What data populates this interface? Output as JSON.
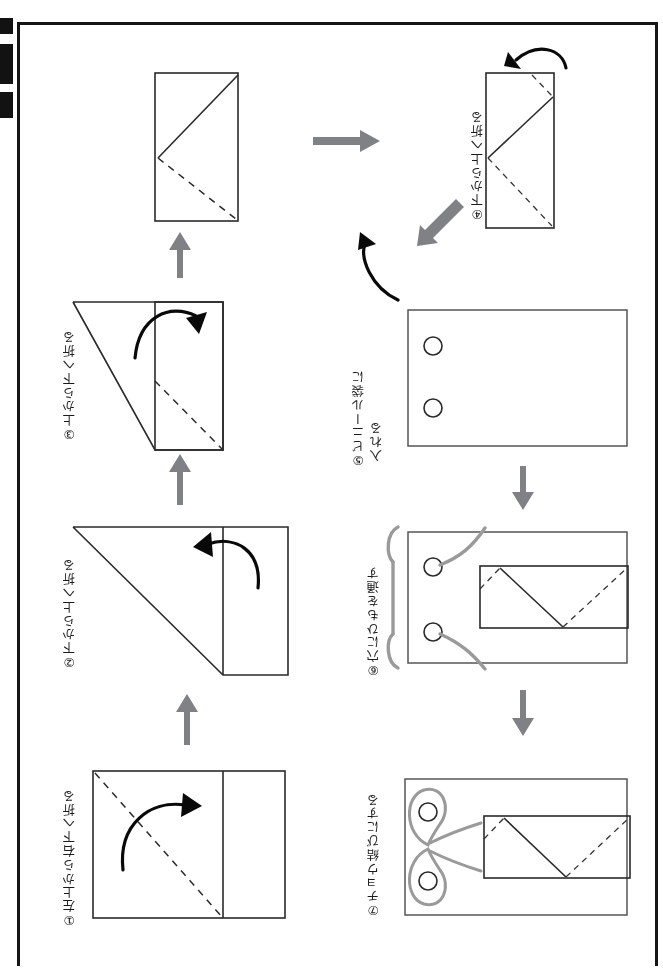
{
  "document": {
    "type": "origami-instruction-diagram",
    "orientation": "rotated-90-ccw-japanese-vertical-text",
    "background_color": "#ffffff",
    "border_color": "#151515"
  },
  "steps": [
    {
      "id": "step-1",
      "number": "①",
      "label": "①左上から右下へ折る",
      "meaning": "fold from upper-left to lower-right",
      "figure": "rectangle-with-vertical-fold-line-and-dashed-diagonal"
    },
    {
      "id": "step-2",
      "number": "②",
      "label": "②下から上へ折る",
      "meaning": "fold from bottom to top",
      "figure": "triangle-plus-right-strip"
    },
    {
      "id": "step-3",
      "number": "③",
      "label": "③上から下へ折る",
      "meaning": "fold from top to bottom",
      "figure": "triangle-plus-tall-rectangle-with-dashed-diagonal"
    },
    {
      "id": "step-4",
      "number": "④",
      "label": "④下から上へ折る",
      "meaning": "fold from bottom to top",
      "figure": "tall-rectangle-with-zigzag-and-dashed-lines"
    },
    {
      "id": "step-5",
      "number": "⑤",
      "label_line1": "⑤ビニール袋に",
      "label_line2": "入れる",
      "label": "⑤ビニール袋に入れる",
      "meaning": "put it into a plastic bag",
      "figure": "bag-rectangle-with-two-holes"
    },
    {
      "id": "step-6",
      "number": "⑥",
      "label": "⑥穴にひもを通す",
      "meaning": "pass the string through the holes",
      "figure": "bag-with-folded-item-and-strings"
    },
    {
      "id": "step-7",
      "number": "⑦",
      "label": "⑦チョウ結びにする",
      "meaning": "tie it in a bow",
      "figure": "bag-with-bow-knot"
    }
  ],
  "intermediate_figure": {
    "id": "figure-after-step-3",
    "description": "tall rectangle result after step 3 with solid and dashed diagonals"
  },
  "flow_arrows": [
    {
      "id": "arrow-1-to-2",
      "direction": "up",
      "color": "#808184"
    },
    {
      "id": "arrow-2-to-3",
      "direction": "up",
      "color": "#808184"
    },
    {
      "id": "arrow-3-to-result",
      "direction": "up",
      "color": "#808184"
    },
    {
      "id": "arrow-result-to-4",
      "direction": "right",
      "color": "#808184"
    },
    {
      "id": "arrow-4-to-5",
      "direction": "down-left",
      "color": "#808184"
    },
    {
      "id": "arrow-5-to-6",
      "direction": "down",
      "color": "#808184"
    },
    {
      "id": "arrow-6-to-7",
      "direction": "down",
      "color": "#808184"
    }
  ],
  "fold_arrows": [
    {
      "id": "fold-arrow-step-1",
      "style": "black-curved"
    },
    {
      "id": "fold-arrow-step-2",
      "style": "black-curved"
    },
    {
      "id": "fold-arrow-step-3",
      "style": "black-curved"
    },
    {
      "id": "fold-arrow-step-4",
      "style": "black-curved"
    },
    {
      "id": "fold-arrow-step-5",
      "style": "black-curved"
    }
  ]
}
